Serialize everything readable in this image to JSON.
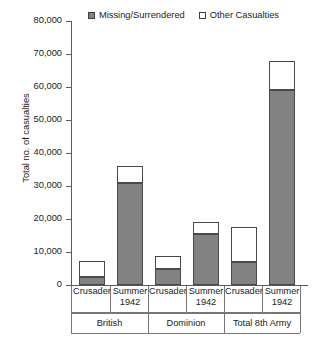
{
  "chart_data": {
    "type": "bar",
    "title": "",
    "subtitle": "",
    "xlabel": "",
    "ylabel": "Total no. of casualties",
    "ylim": [
      0,
      80000
    ],
    "ytick_labels": [
      "0",
      "10,000",
      "20,000",
      "30,000",
      "40,000",
      "50,000",
      "60,000",
      "70,000",
      "80,000"
    ],
    "ytick_values": [
      0,
      10000,
      20000,
      30000,
      40000,
      50000,
      60000,
      70000,
      80000
    ],
    "grid": false,
    "stacked": true,
    "legend_position": "top",
    "categories": [
      "Crusader",
      "Summer 1942",
      "Crusader",
      "Summer 1942",
      "Crusader",
      "Summer 1942"
    ],
    "group_labels": [
      "British",
      "Dominion",
      "Total 8th Army"
    ],
    "series": [
      {
        "name": "Missing/Surrendered",
        "color": "#828282",
        "values": [
          2500,
          31000,
          5000,
          15500,
          7000,
          59000
        ]
      },
      {
        "name": "Other Casualties",
        "color": "#ffffff",
        "values": [
          4700,
          5000,
          3800,
          3500,
          10500,
          9000
        ]
      }
    ],
    "totals": [
      7200,
      36000,
      8800,
      19000,
      17500,
      68000
    ]
  },
  "legend": {
    "entries": [
      {
        "label": "Missing/Surrendered",
        "style": "filled"
      },
      {
        "label": "Other Casualties",
        "style": "open"
      }
    ]
  },
  "axis": {
    "y_title": "Total no. of casualties"
  },
  "categories": [
    {
      "line1": "Crusader",
      "line2": ""
    },
    {
      "line1": "Summer",
      "line2": "1942"
    },
    {
      "line1": "Crusader",
      "line2": ""
    },
    {
      "line1": "Summer",
      "line2": "1942"
    },
    {
      "line1": "Crusader",
      "line2": ""
    },
    {
      "line1": "Summer",
      "line2": "1942"
    }
  ],
  "groups": [
    {
      "label": "British"
    },
    {
      "label": "Dominion"
    },
    {
      "label": "Total 8th Army"
    }
  ],
  "colors": {
    "missing_surrendered": "#828282",
    "other_casualties": "#ffffff",
    "axis": "#5a5a5a",
    "outline": "#4a4a4a",
    "text": "#222222"
  }
}
